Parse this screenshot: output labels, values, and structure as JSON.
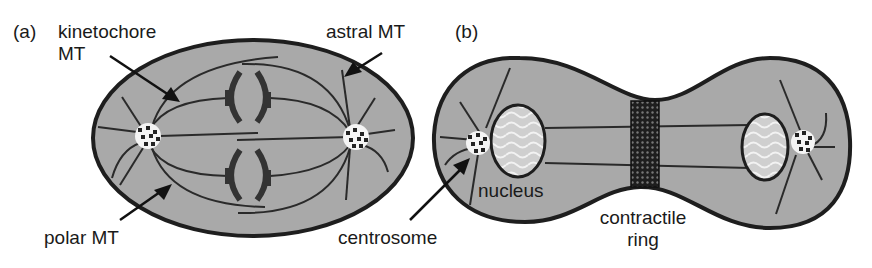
{
  "panel_a": {
    "tag": "(a)",
    "labels": {
      "kinetochore_line1": "kinetochore",
      "kinetochore_line2": "MT",
      "astral": "astral MT",
      "polar": "polar MT"
    }
  },
  "panel_b": {
    "tag": "(b)",
    "labels": {
      "nucleus": "nucleus",
      "centrosome": "centrosome",
      "contractile_line1": "contractile",
      "contractile_line2": "ring"
    }
  },
  "colors": {
    "cytoplasm": "#a8a8a8",
    "outline": "#1e1e1e",
    "nucleus": "#d8d8d8",
    "ring": "#222222"
  }
}
